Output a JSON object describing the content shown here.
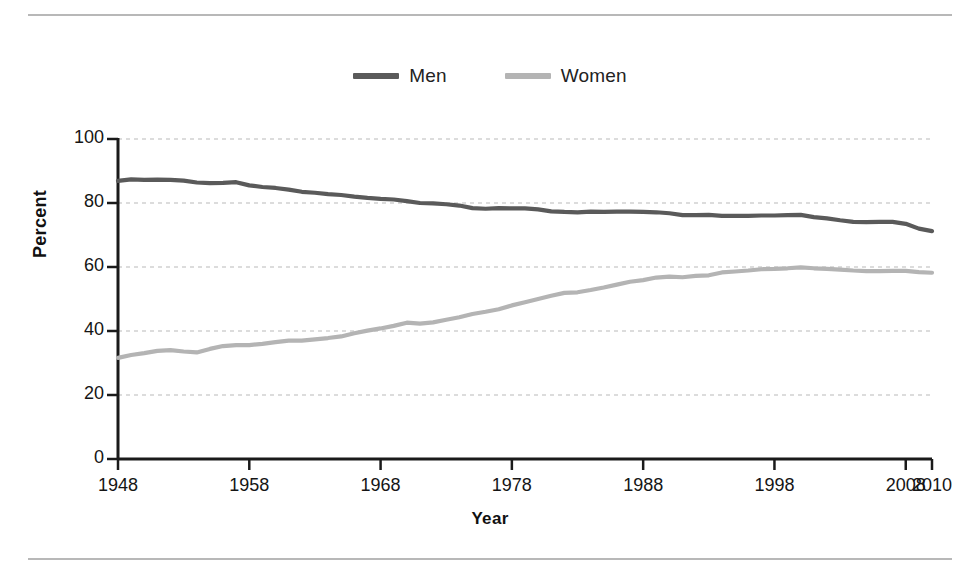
{
  "chart_data": {
    "type": "line",
    "title": "",
    "xlabel": "Year",
    "ylabel": "Percent",
    "xlim": [
      1948,
      2010
    ],
    "ylim": [
      0,
      100
    ],
    "grid": true,
    "grid_axis": "y",
    "legend_position": "top-center",
    "x_ticks": [
      1948,
      1958,
      1968,
      1978,
      1988,
      1998,
      2008,
      2010
    ],
    "x_tick_labels": [
      "1948",
      "1958",
      "1968",
      "1978",
      "1988",
      "1998",
      "2008",
      "2010"
    ],
    "y_ticks": [
      0,
      20,
      40,
      60,
      80,
      100
    ],
    "y_tick_labels": [
      "0",
      "20",
      "40",
      "60",
      "80",
      "100"
    ],
    "x": [
      1948,
      1949,
      1950,
      1951,
      1952,
      1953,
      1954,
      1955,
      1956,
      1957,
      1958,
      1959,
      1960,
      1961,
      1962,
      1963,
      1964,
      1965,
      1966,
      1967,
      1968,
      1969,
      1970,
      1971,
      1972,
      1973,
      1974,
      1975,
      1976,
      1977,
      1978,
      1979,
      1980,
      1981,
      1982,
      1983,
      1984,
      1985,
      1986,
      1987,
      1988,
      1989,
      1990,
      1991,
      1992,
      1993,
      1994,
      1995,
      1996,
      1997,
      1998,
      1999,
      2000,
      2001,
      2002,
      2003,
      2004,
      2005,
      2006,
      2007,
      2008,
      2009,
      2010
    ],
    "series": [
      {
        "name": "Men",
        "color": "#5a5a5a",
        "values": [
          86.9,
          87.4,
          87.2,
          87.3,
          87.2,
          87.0,
          86.4,
          86.2,
          86.3,
          86.5,
          85.5,
          85.0,
          84.7,
          84.2,
          83.5,
          83.2,
          82.8,
          82.5,
          82.0,
          81.6,
          81.3,
          81.1,
          80.6,
          80.0,
          79.9,
          79.6,
          79.2,
          78.4,
          78.2,
          78.4,
          78.3,
          78.3,
          78.0,
          77.4,
          77.2,
          77.1,
          77.3,
          77.2,
          77.3,
          77.3,
          77.2,
          77.1,
          76.8,
          76.2,
          76.2,
          76.3,
          76.0,
          76.0,
          76.0,
          76.1,
          76.1,
          76.2,
          76.3,
          75.6,
          75.2,
          74.6,
          74.1,
          74.0,
          74.1,
          74.1,
          73.5,
          72.0,
          71.2
        ]
      },
      {
        "name": "Women",
        "color": "#b4b4b4",
        "values": [
          31.6,
          32.5,
          33.1,
          33.8,
          34.0,
          33.6,
          33.3,
          34.4,
          35.3,
          35.6,
          35.6,
          36.0,
          36.5,
          37.0,
          37.0,
          37.4,
          37.8,
          38.3,
          39.3,
          40.1,
          40.8,
          41.6,
          42.6,
          42.3,
          42.7,
          43.5,
          44.3,
          45.3,
          46.0,
          46.8,
          48.0,
          49.0,
          50.0,
          51.0,
          51.9,
          52.1,
          52.8,
          53.6,
          54.5,
          55.4,
          55.9,
          56.7,
          57.0,
          56.8,
          57.2,
          57.4,
          58.3,
          58.6,
          58.9,
          59.3,
          59.4,
          59.6,
          59.9,
          59.6,
          59.4,
          59.2,
          58.9,
          58.7,
          58.7,
          58.8,
          58.8,
          58.4,
          58.2
        ]
      }
    ],
    "annotations": []
  },
  "figure": {
    "legend": [
      {
        "label": "Men",
        "swatch_color": "#5a5a5a",
        "icon": "line-swatch-icon"
      },
      {
        "label": "Women",
        "swatch_color": "#b4b4b4",
        "icon": "line-swatch-icon"
      }
    ],
    "axis_titles": {
      "x": "Year",
      "y": "Percent"
    },
    "rules": {
      "top": "horizontal-rule",
      "bottom": "horizontal-rule"
    },
    "colors": {
      "men": "#5a5a5a",
      "women": "#b4b4b4",
      "axis": "#1a1a1a",
      "grid": "#b9b9b9",
      "rule": "#b8b8b8"
    }
  }
}
